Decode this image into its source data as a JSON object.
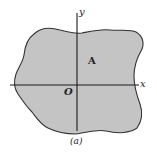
{
  "figure": {
    "axes": {
      "x_label": "x",
      "y_label": "y",
      "origin_label": "O"
    },
    "region_label": "A",
    "caption": "(a)",
    "colors": {
      "region_fill": "#c4c4c4",
      "outline": "#333333",
      "axis": "#1a1a1a",
      "background": "#ffffff"
    }
  }
}
